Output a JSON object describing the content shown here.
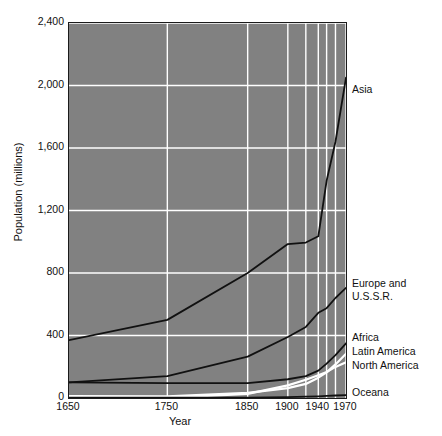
{
  "chart_data": {
    "type": "line",
    "title": "",
    "xlabel": "Year",
    "ylabel": "Population (millions)",
    "ylim": [
      0,
      2400
    ],
    "yticks": [
      0,
      400,
      800,
      1200,
      1600,
      2000,
      2400
    ],
    "ytick_labels": [
      "0",
      "400",
      "800",
      "1,200",
      "1,600",
      "2,000",
      "2,400"
    ],
    "x": [
      1650,
      1750,
      1850,
      1900,
      1920,
      1940,
      1950,
      1960,
      1970
    ],
    "xticks": [
      1650,
      1750,
      1850,
      1900,
      1940,
      1970
    ],
    "xtick_labels": [
      "1650",
      "1750",
      "1850",
      "1900",
      "1940",
      "1970"
    ],
    "gridlines_x": [
      1650,
      1750,
      1850,
      1900,
      1920,
      1940,
      1950,
      1960,
      1970
    ],
    "grid": true,
    "legend_position": "right-inline-callouts",
    "plot_background": "#818181",
    "gridline_color": "#ffffff",
    "series": [
      {
        "name": "Asia",
        "color": "#111111",
        "label_x": 352,
        "label_y": 83,
        "values": [
          370,
          500,
          800,
          985,
          995,
          1035,
          1390,
          1640,
          2050
        ]
      },
      {
        "name": "Europe and U.S.S.R.",
        "color": "#111111",
        "label_x": 352,
        "label_y": 277,
        "label_line2": "U.S.S.R.",
        "values": [
          100,
          140,
          265,
          390,
          455,
          545,
          575,
          640,
          705
        ]
      },
      {
        "name": "Africa",
        "color": "#111111",
        "label_x": 352,
        "label_y": 331,
        "values": [
          100,
          95,
          95,
          120,
          140,
          175,
          220,
          275,
          350
        ]
      },
      {
        "name": "Latin America",
        "color": "#ffffff",
        "label_x": 352,
        "label_y": 345,
        "values": [
          12,
          11,
          33,
          63,
          90,
          130,
          164,
          215,
          283
        ]
      },
      {
        "name": "North America",
        "color": "#ffffff",
        "label_x": 352,
        "label_y": 359,
        "values": [
          1,
          1,
          26,
          81,
          117,
          146,
          166,
          199,
          228
        ]
      },
      {
        "name": "Oceana",
        "color": "#111111",
        "label_x": 352,
        "label_y": 386,
        "values": [
          2,
          2,
          2,
          6,
          9,
          11,
          13,
          16,
          19
        ]
      }
    ]
  }
}
